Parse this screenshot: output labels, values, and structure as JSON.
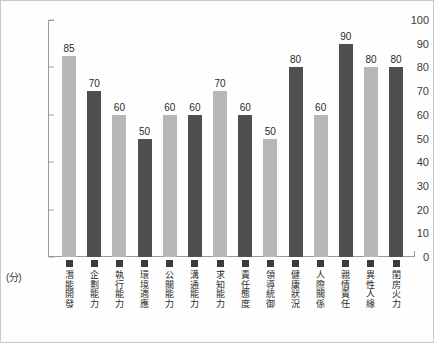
{
  "chart_data": {
    "type": "bar",
    "title": "",
    "xlabel": "",
    "ylabel": "",
    "unit_label": "(分)",
    "ylim": [
      0,
      100
    ],
    "ytick_step": 10,
    "grid": false,
    "legend_position": "none",
    "yticks": [
      "100",
      "90",
      "80",
      "70",
      "60",
      "50",
      "40",
      "30",
      "20",
      "10",
      "0"
    ],
    "categories": [
      "潛能開發",
      "企劃能力",
      "執行能力",
      "環境適應",
      "公關能力",
      "溝通能力",
      "求知能力",
      "責任態度",
      "領導統御",
      "健康狀況",
      "人際關係",
      "親情責任",
      "異性人緣",
      "閨房火力"
    ],
    "values": [
      85,
      70,
      60,
      50,
      60,
      60,
      70,
      60,
      50,
      80,
      60,
      90,
      80,
      80
    ],
    "bar_colors": [
      "#b7b7b7",
      "#4f4f4f",
      "#b7b7b7",
      "#4f4f4f",
      "#b7b7b7",
      "#4f4f4f",
      "#b7b7b7",
      "#4f4f4f",
      "#b7b7b7",
      "#4f4f4f",
      "#b7b7b7",
      "#4f4f4f",
      "#b7b7b7",
      "#4f4f4f"
    ],
    "colors": {
      "light_bar": "#b7b7b7",
      "dark_bar": "#4f4f4f",
      "axis": "#9a9a9a",
      "text": "#2b2b2b",
      "background": "#ffffff",
      "frame": "#c9c9c9"
    }
  }
}
